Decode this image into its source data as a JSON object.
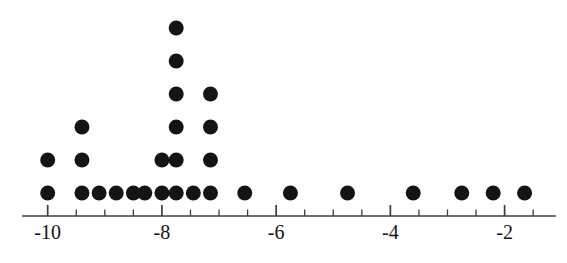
{
  "chart_data": {
    "type": "scatter",
    "plot_kind": "dot-plot",
    "title": "",
    "xlabel": "",
    "ylabel": "",
    "grid": false,
    "legend": false,
    "xlim": [
      -10.45,
      -1.1
    ],
    "axis": {
      "major_ticks": [
        -10,
        -8,
        -6,
        -4,
        -2
      ],
      "major_tick_labels": [
        "-10",
        "-8",
        "-6",
        "-4",
        "-2"
      ],
      "minor_tick_step": 0.5,
      "minor_ticks": [
        -10.0,
        -9.5,
        -9.0,
        -8.5,
        -8.0,
        -7.5,
        -7.0,
        -6.5,
        -6.0,
        -5.5,
        -5.0,
        -4.5,
        -4.0,
        -3.5,
        -3.0,
        -2.5,
        -2.0,
        -1.5
      ],
      "line_color": "#3c3c3c",
      "tick_color": "#3c3c3c"
    },
    "dot": {
      "color": "#141414",
      "radius_px": 7.5,
      "row_spacing_px": 33,
      "baseline_y_px": 193
    },
    "columns": [
      {
        "x": -10.0,
        "count": 2
      },
      {
        "x": -9.4,
        "count": 3
      },
      {
        "x": -9.1,
        "count": 1
      },
      {
        "x": -8.8,
        "count": 1
      },
      {
        "x": -8.5,
        "count": 1
      },
      {
        "x": -8.3,
        "count": 1
      },
      {
        "x": -8.0,
        "count": 2
      },
      {
        "x": -7.75,
        "count": 6
      },
      {
        "x": -7.45,
        "count": 1
      },
      {
        "x": -7.15,
        "count": 4
      },
      {
        "x": -6.55,
        "count": 1
      },
      {
        "x": -5.75,
        "count": 1
      },
      {
        "x": -4.75,
        "count": 1
      },
      {
        "x": -3.6,
        "count": 1
      },
      {
        "x": -2.75,
        "count": 1
      },
      {
        "x": -2.2,
        "count": 1
      },
      {
        "x": -1.65,
        "count": 1
      }
    ],
    "values": [
      -10.0,
      -10.0,
      -9.4,
      -9.4,
      -9.4,
      -9.1,
      -8.8,
      -8.5,
      -8.3,
      -8.0,
      -8.0,
      -7.75,
      -7.75,
      -7.75,
      -7.75,
      -7.75,
      -7.75,
      -7.45,
      -7.15,
      -7.15,
      -7.15,
      -7.15,
      -6.55,
      -5.75,
      -4.75,
      -3.6,
      -2.75,
      -2.2,
      -1.65
    ],
    "total_dots": 29
  }
}
